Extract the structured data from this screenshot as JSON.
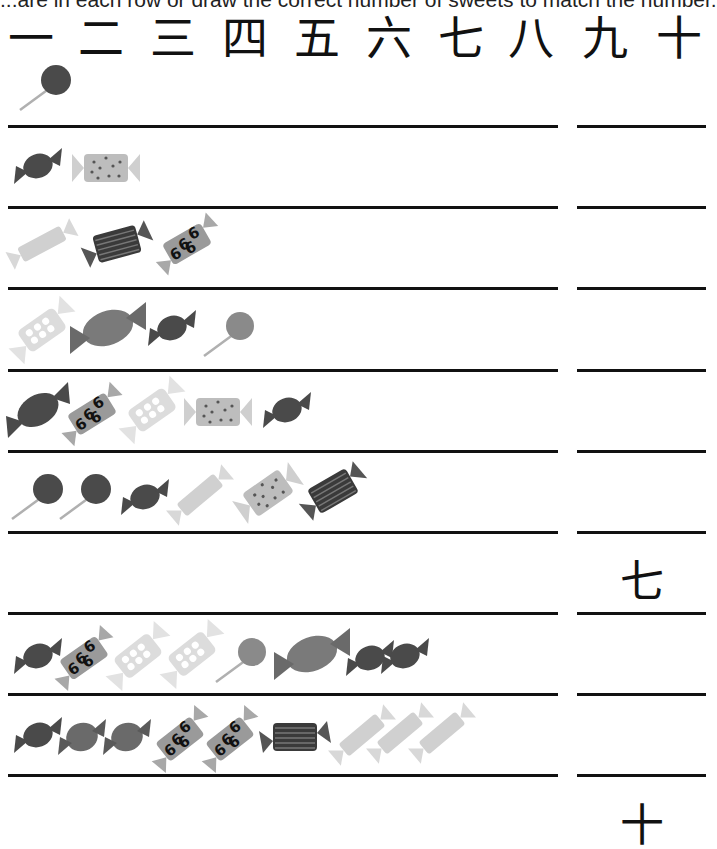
{
  "instruction": "...are in each row or draw the correct number of sweets to match the number.",
  "numerals": [
    "一",
    "二",
    "三",
    "四",
    "五",
    "六",
    "七",
    "八",
    "九",
    "十"
  ],
  "colors": {
    "dark": "#4a4a4a",
    "mid": "#7a7a7a",
    "light": "#b0b0b0",
    "pale": "#d8d8d8",
    "line": "#111111"
  },
  "rows": [
    {
      "count": 1,
      "sweets": [
        "lollipop-dark"
      ],
      "answer": ""
    },
    {
      "count": 2,
      "sweets": [
        "wrapped-round-dark",
        "wrapped-dotted-rect"
      ],
      "answer": ""
    },
    {
      "count": 3,
      "sweets": [
        "wrapped-stick-pale",
        "wrapped-striped-rect",
        "wrapped-swirl-rect"
      ],
      "answer": ""
    },
    {
      "count": 4,
      "sweets": [
        "wrapped-heart-pale",
        "wrapped-oval-mid",
        "wrapped-round-dark",
        "lollipop-mid"
      ],
      "answer": ""
    },
    {
      "count": 5,
      "sweets": [
        "wrapped-oval-dark",
        "wrapped-swirl-rect",
        "wrapped-heart-pale",
        "wrapped-dotted-rect",
        "wrapped-round-dark"
      ],
      "answer": ""
    },
    {
      "count": 6,
      "sweets": [
        "lollipop-dark",
        "lollipop-dark",
        "wrapped-round-dark",
        "wrapped-stick-pale",
        "wrapped-dotted-rect",
        "wrapped-striped-rect"
      ],
      "answer": ""
    },
    {
      "count": 7,
      "sweets": [],
      "answer": "七"
    },
    {
      "count": 8,
      "sweets": [
        "wrapped-round-dark",
        "wrapped-swirl-rect",
        "wrapped-heart-pale",
        "wrapped-heart-pale",
        "lollipop-mid",
        "wrapped-oval-mid",
        "wrapped-round-dark",
        "wrapped-round-dark"
      ],
      "answer": ""
    },
    {
      "count": 9,
      "sweets": [
        "wrapped-round-dark",
        "wrapped-round-mid",
        "wrapped-round-mid",
        "wrapped-swirl-rect",
        "wrapped-swirl-rect",
        "wrapped-striped-rect",
        "wrapped-stick-pale",
        "wrapped-stick-pale",
        "wrapped-stick-pale"
      ],
      "answer": ""
    },
    {
      "count": 10,
      "sweets": [],
      "answer": "十"
    }
  ]
}
